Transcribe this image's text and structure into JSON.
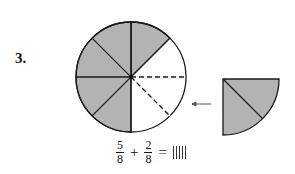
{
  "problem": {
    "number": "3.",
    "circle": {
      "total_parts": 8,
      "shaded_parts": 5,
      "dashed_empty_parts": 2
    },
    "wedge": {
      "parts": 2,
      "shaded": true
    },
    "arrow": "left-arrow",
    "equation": {
      "frac1": {
        "num": "5",
        "den": "8"
      },
      "op": "+",
      "frac2": {
        "num": "2",
        "den": "8"
      },
      "eq": "=",
      "answer_placeholder": "answer-box"
    },
    "colors": {
      "shade": "#b3b3b3",
      "line": "#1a1a1a"
    }
  }
}
